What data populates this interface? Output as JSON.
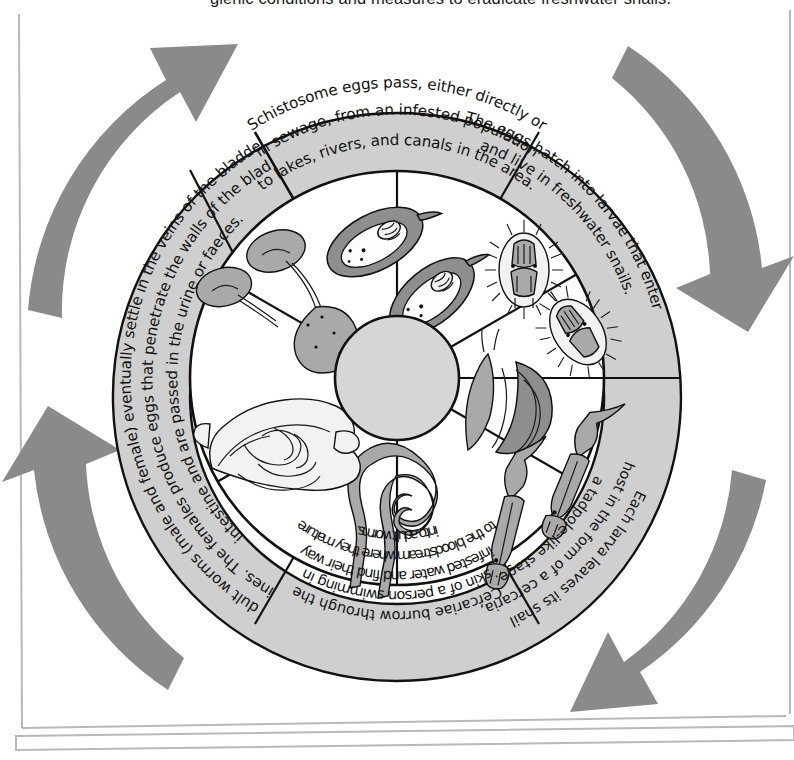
{
  "page": {
    "clipped_top_caption": "gienic conditions and measures to eradicate freshwater snails.",
    "background_color": "#ffffff",
    "ring_fill_color": "#cfcfcf",
    "hub_fill_color": "#d6d6d6",
    "outline_color": "#111111",
    "arrow_color": "#8a8a8a"
  },
  "diagram": {
    "type": "cycle-wheel",
    "direction": "clockwise",
    "segment_count": 6,
    "ring_segments": [
      {
        "id": "eggs-pass",
        "position": "top",
        "start_angle_deg": -60,
        "end_angle_deg": -120,
        "lines": [
          "Schistosome eggs pass, either directly or",
          "in sewage, from an infested population",
          "to lakes, rivers, and canals in the area."
        ],
        "text_flip": false
      },
      {
        "id": "eggs-hatch",
        "position": "top-right",
        "start_angle_deg": -60,
        "end_angle_deg": 0,
        "lines": [
          "The eggs hatch into larvae that enter",
          "and live in freshwater snails."
        ],
        "text_flip": false
      },
      {
        "id": "larva-leaves-snail",
        "position": "bottom-right",
        "start_angle_deg": 0,
        "end_angle_deg": 60,
        "lines": [
          "Each larva leaves its snail",
          "host in the form of a cercaria,",
          "a tadpole-like stage."
        ],
        "text_flip": false
      },
      {
        "id": "cercariae-burrow",
        "position": "bottom",
        "start_angle_deg": 60,
        "end_angle_deg": 120,
        "lines": [
          "Cercariae burrow through the",
          "skin of a person swimming in",
          "infested water and find their way",
          "to the bloodstream where they mature",
          "into adult worms."
        ],
        "text_flip": true
      },
      {
        "id": "adult-worms-settle",
        "position": "left",
        "start_angle_deg": 120,
        "end_angle_deg": 240,
        "lines": [
          "The adult worms (male and female) eventually settle in the veins of the bladder and",
          "intestines. The females produce eggs that penetrate the walls of the bladder or",
          "intestine and are passed in the urine or faeces."
        ],
        "text_flip": true
      }
    ],
    "inner_sectors": [
      {
        "id": "eggs",
        "label": "schistosome-eggs",
        "position": "top"
      },
      {
        "id": "miracidia",
        "label": "miracidia-larvae",
        "position": "upper-right"
      },
      {
        "id": "snail-cercaria",
        "label": "freshwater-snail-with-emerging-cercaria",
        "position": "right"
      },
      {
        "id": "cercariae",
        "label": "free-swimming-cercariae",
        "position": "lower-right"
      },
      {
        "id": "adult-worms",
        "label": "adult-worm-pair",
        "position": "bottom"
      },
      {
        "id": "intestines",
        "label": "human-intestines",
        "position": "lower-left"
      },
      {
        "id": "kidneys-bladder",
        "label": "kidneys-ureters-and-bladder",
        "position": "upper-left"
      }
    ],
    "arrows": [
      {
        "id": "arrow-top-left",
        "points_to": "clockwise",
        "position": "top-left-outside"
      },
      {
        "id": "arrow-top-right",
        "points_to": "clockwise",
        "position": "top-right-outside"
      },
      {
        "id": "arrow-bottom-right",
        "points_to": "clockwise",
        "position": "bottom-right-outside"
      },
      {
        "id": "arrow-bottom-left",
        "points_to": "clockwise",
        "position": "bottom-left-outside"
      }
    ]
  }
}
